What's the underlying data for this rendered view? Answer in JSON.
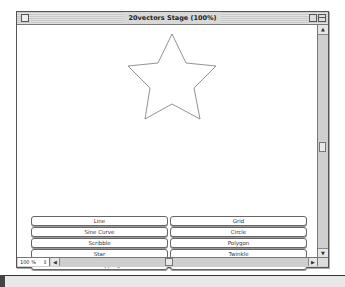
{
  "window": {
    "title": "20vectors Stage (100%)",
    "zoom_level": "100 %",
    "zoom_arrows": "⇕",
    "scroll_up": "▲",
    "scroll_down": "▼",
    "scroll_left": "◀",
    "scroll_right": "▶"
  },
  "stage": {
    "shape": "star",
    "star_points": "155,9 141,38 111,41 133,63 128,94 155,79 183,94 177,63 199,41 169,38"
  },
  "buttons": [
    {
      "label": "Line"
    },
    {
      "label": "Grid"
    },
    {
      "label": "Sine Curve"
    },
    {
      "label": "Circle"
    },
    {
      "label": "Scribble"
    },
    {
      "label": "Polygon"
    },
    {
      "label": "Star"
    },
    {
      "label": "Twinkle"
    },
    {
      "label": "Blood Dripping"
    },
    {
      "label": "Waves"
    }
  ]
}
